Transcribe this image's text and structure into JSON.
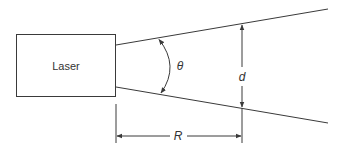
{
  "diagram": {
    "laser_label": "Laser",
    "angle_label": "θ",
    "diameter_label": "d",
    "range_label": "R",
    "colors": {
      "stroke": "#3a3a3a",
      "text": "#333333",
      "background": "#ffffff"
    }
  }
}
